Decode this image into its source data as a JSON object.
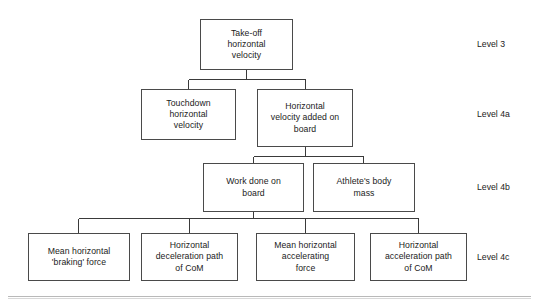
{
  "diagram": {
    "type": "hierarchical-flowchart",
    "title_text": "",
    "background_color": "#ffffff",
    "box_border_color": "#4a4a4a",
    "connector_color": "#3a3a3a",
    "text_color": "#1b1b1b",
    "rule_color": "#b9b9b9",
    "levels": [
      {
        "id": "level-3",
        "label": "Level 3"
      },
      {
        "id": "level-4a",
        "label": "Level 4a"
      },
      {
        "id": "level-4b",
        "label": "Level 4b"
      },
      {
        "id": "level-4c",
        "label": "Level 4c"
      }
    ],
    "nodes": [
      {
        "id": "take-off-horizontal-velocity",
        "level": "Level 3",
        "label": "Take-off\nhorizontal\nvelocity"
      },
      {
        "id": "touchdown-horizontal-velocity",
        "level": "Level 4a",
        "label": "Touchdown\nhorizontal\nvelocity"
      },
      {
        "id": "horizontal-velocity-added-on-board",
        "level": "Level 4a",
        "label": "Horizontal\nvelocity added on\nboard"
      },
      {
        "id": "work-done-on-board",
        "level": "Level 4b",
        "label": "Work done on\nboard"
      },
      {
        "id": "athletes-body-mass",
        "level": "Level 4b",
        "label": "Athlete's body\nmass"
      },
      {
        "id": "mean-horizontal-braking-force",
        "level": "Level 4c",
        "label": "Mean horizontal\n'braking' force"
      },
      {
        "id": "horizontal-deceleration-path-of-com",
        "level": "Level 4c",
        "label": "Horizontal\ndeceleration path\nof CoM"
      },
      {
        "id": "mean-horizontal-accelerating-force",
        "level": "Level 4c",
        "label": "Mean horizontal\naccelerating\nforce"
      },
      {
        "id": "horizontal-acceleration-path-of-com",
        "level": "Level 4c",
        "label": "Horizontal\nacceleration path\nof CoM"
      }
    ],
    "edges": [
      {
        "from": "take-off-horizontal-velocity",
        "to": "touchdown-horizontal-velocity"
      },
      {
        "from": "take-off-horizontal-velocity",
        "to": "horizontal-velocity-added-on-board"
      },
      {
        "from": "horizontal-velocity-added-on-board",
        "to": "work-done-on-board"
      },
      {
        "from": "horizontal-velocity-added-on-board",
        "to": "athletes-body-mass"
      },
      {
        "from": "work-done-on-board",
        "to": "mean-horizontal-braking-force"
      },
      {
        "from": "work-done-on-board",
        "to": "horizontal-deceleration-path-of-com"
      },
      {
        "from": "work-done-on-board",
        "to": "mean-horizontal-accelerating-force"
      },
      {
        "from": "work-done-on-board",
        "to": "horizontal-acceleration-path-of-com"
      }
    ]
  }
}
